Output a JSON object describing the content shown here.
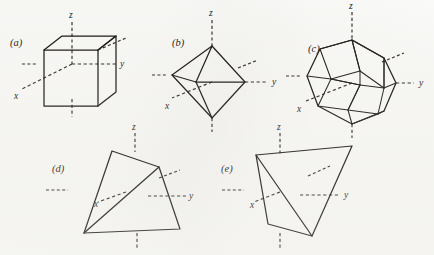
{
  "figure": {
    "background_color": "#fbfbf9",
    "line_color": "#15130f",
    "axis_color": "#2a2723",
    "axis_style": "dashed",
    "panel_count": 5
  },
  "panels": [
    {
      "id": "a",
      "label": "(a)",
      "shape": "cube",
      "axes": [
        {
          "name": "z",
          "label": "z"
        },
        {
          "name": "y",
          "label": "y"
        },
        {
          "name": "x",
          "label": "x"
        }
      ]
    },
    {
      "id": "b",
      "label": "(b)",
      "shape": "octahedron",
      "axes": [
        {
          "name": "z",
          "label": "z"
        },
        {
          "name": "y",
          "label": "y"
        },
        {
          "name": "x",
          "label": "x"
        }
      ]
    },
    {
      "id": "c",
      "label": "(c)",
      "shape": "cuboctahedron",
      "axes": [
        {
          "name": "z",
          "label": "z"
        },
        {
          "name": "y",
          "label": "y"
        },
        {
          "name": "x",
          "label": "x"
        }
      ]
    },
    {
      "id": "d",
      "label": "(d)",
      "shape": "tetrahedron",
      "axes": [
        {
          "name": "z",
          "label": "z"
        },
        {
          "name": "y",
          "label": "y"
        },
        {
          "name": "x",
          "label": "x"
        }
      ]
    },
    {
      "id": "e",
      "label": "(e)",
      "shape": "tetrahedron",
      "axes": [
        {
          "name": "z",
          "label": "z"
        },
        {
          "name": "y",
          "label": "y"
        },
        {
          "name": "x",
          "label": "x"
        }
      ]
    }
  ],
  "labels": {
    "panel_a": "(a)",
    "panel_b": "(b)",
    "panel_c": "(c)",
    "panel_d": "(d)",
    "panel_e": "(e)",
    "axis_x": "x",
    "axis_y": "y",
    "axis_z": "z"
  }
}
